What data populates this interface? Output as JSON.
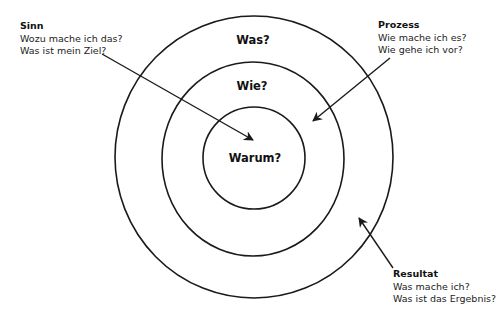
{
  "diagram": {
    "type": "golden-circle",
    "stroke_color": "#1a1a1a",
    "background": "#ffffff",
    "rings": [
      {
        "id": "outer",
        "label": "Was?",
        "cx": 254,
        "cy": 157,
        "rx": 139,
        "ry": 141
      },
      {
        "id": "middle",
        "label": "Wie?",
        "cx": 253,
        "cy": 159,
        "rx": 91,
        "ry": 97
      },
      {
        "id": "inner",
        "label": "Warum?",
        "cx": 254,
        "cy": 158,
        "rx": 51,
        "ry": 51
      }
    ],
    "annotations": {
      "sinn": {
        "title": "Sinn",
        "lines": [
          "Wozu mache ich das?",
          "Was ist mein Ziel?"
        ],
        "arrow": {
          "x1": 102,
          "y1": 54,
          "x2": 253,
          "y2": 140
        }
      },
      "prozess": {
        "title": "Prozess",
        "lines": [
          "Wie mache ich es?",
          "Wie gehe ich vor?"
        ],
        "arrow": {
          "x1": 390,
          "y1": 58,
          "x2": 313,
          "y2": 121
        }
      },
      "resultat": {
        "title": "Resultat",
        "lines": [
          "Was mache ich?",
          "Was ist das Ergebnis?"
        ],
        "arrow": {
          "x1": 393,
          "y1": 268,
          "x2": 359,
          "y2": 218
        }
      }
    }
  }
}
